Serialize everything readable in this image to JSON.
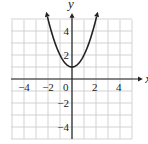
{
  "chart_data": {
    "type": "line",
    "title": "",
    "function": "y = x^2 + 1",
    "xlabel": "x",
    "ylabel": "y",
    "xlim": [
      -5,
      5
    ],
    "ylim": [
      -5,
      5
    ],
    "grid": true,
    "x_ticks": [
      -4,
      -2,
      0,
      2,
      4
    ],
    "x_tick_labels": [
      "−4",
      "−2",
      "0",
      "2",
      "4"
    ],
    "y_ticks": [
      4,
      2,
      -2,
      -4
    ],
    "y_tick_labels": [
      "4",
      "2",
      "−2",
      "−4"
    ],
    "series": [
      {
        "name": "parabola",
        "x": [
          -2.2,
          -2,
          -1.5,
          -1,
          -0.5,
          0,
          0.5,
          1,
          1.5,
          2,
          2.2
        ],
        "y": [
          5.84,
          5,
          3.25,
          2,
          1.25,
          1,
          1.25,
          2,
          3.25,
          5,
          5.84
        ],
        "arrows_on_both_ends": true
      }
    ],
    "vertex": [
      0,
      1
    ]
  },
  "colors": {
    "grid": "#c8c8c8",
    "axis": "#222222",
    "curve": "#222222"
  }
}
